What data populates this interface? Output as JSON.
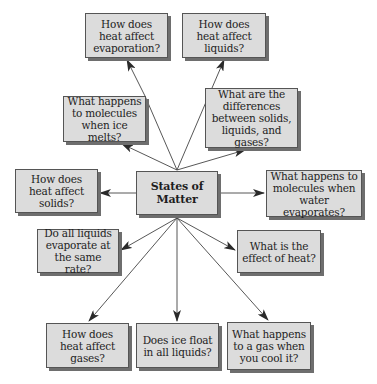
{
  "diagram": {
    "type": "concept-map",
    "center": {
      "id": "center",
      "label": "States of Matter",
      "lines": [
        "States of",
        "Matter"
      ]
    },
    "nodes": [
      {
        "id": "evaporation",
        "label": "How does heat affect evaporation?",
        "lines": [
          "How does heat",
          "affect",
          "evaporation?"
        ]
      },
      {
        "id": "liquids",
        "label": "How does heat affect liquids?",
        "lines": [
          "How does heat",
          "affect liquids?"
        ]
      },
      {
        "id": "ice-melts",
        "label": "What happens to molecules when ice melts?",
        "lines": [
          "What happens",
          "to molecules",
          "when ice melts?"
        ]
      },
      {
        "id": "differences",
        "label": "What are the differences between solids, liquids, and gases?",
        "lines": [
          "What are the",
          "differences",
          "between solids,",
          "liquids, and gases?"
        ]
      },
      {
        "id": "solids",
        "label": "How does heat affect solids?",
        "lines": [
          "How does heat",
          "affect solids?"
        ]
      },
      {
        "id": "water-evaporates",
        "label": "What happens to molecules when water evaporates?",
        "lines": [
          "What happens to",
          "molecules when",
          "water evaporates?"
        ]
      },
      {
        "id": "same-rate",
        "label": "Do all liquids evaporate at the same rate?",
        "lines": [
          "Do all liquids",
          "evaporate at the",
          "same rate?"
        ]
      },
      {
        "id": "effect-heat",
        "label": "What is the effect of heat?",
        "lines": [
          "What is the",
          "effect of heat?"
        ]
      },
      {
        "id": "gases",
        "label": "How does heat affect gases?",
        "lines": [
          "How does heat",
          "affect gases?"
        ]
      },
      {
        "id": "ice-float",
        "label": "Does ice float in all liquids?",
        "lines": [
          "Does ice float in",
          "all liquids?"
        ]
      },
      {
        "id": "gas-cool",
        "label": "What happens to a gas when you cool it?",
        "lines": [
          "What happens",
          "to a gas when",
          "you cool it?"
        ]
      }
    ],
    "edges": [
      {
        "from": "ice-melts",
        "to": "evaporation"
      },
      {
        "from": "differences",
        "to": "liquids"
      },
      {
        "from": "center",
        "to": "ice-melts"
      },
      {
        "from": "center",
        "to": "differences"
      },
      {
        "from": "center",
        "to": "solids"
      },
      {
        "from": "center",
        "to": "water-evaporates"
      },
      {
        "from": "center",
        "to": "same-rate"
      },
      {
        "from": "center",
        "to": "effect-heat"
      },
      {
        "from": "center",
        "to": "gases"
      },
      {
        "from": "center",
        "to": "ice-float"
      },
      {
        "from": "center",
        "to": "gas-cool"
      }
    ],
    "colors": {
      "box_fill": "#dcdcdc",
      "box_border": "#555555",
      "shadow": "#6e6e6e",
      "line": "#444444",
      "text": "#1e1e1e"
    }
  }
}
